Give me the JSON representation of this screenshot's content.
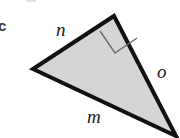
{
  "figure": {
    "part_label": "c",
    "background_color": "#ffffff",
    "width": 180,
    "height": 138
  },
  "shape": {
    "name": "right-triangle",
    "fill_color": "#d5d5d5",
    "stroke_color": "#111111",
    "stroke_width": 4,
    "vertices": [
      {
        "name": "left-vertex",
        "x": 33,
        "y": 69
      },
      {
        "name": "top-vertex",
        "x": 114,
        "y": 16
      },
      {
        "name": "bottom-right-vertex",
        "x": 176,
        "y": 136
      }
    ],
    "points_attr": "33,69 114,16 176,136"
  },
  "right_angle": {
    "at_vertex": "top-vertex",
    "marker_color": "#6a6a6a",
    "marker_width": 1.4,
    "points_attr": "100,31 115,53 137,38"
  },
  "labels": {
    "n": "n",
    "o": "o",
    "m": "m"
  },
  "sides": [
    {
      "id": "n",
      "label": "n",
      "from": "left-vertex",
      "to": "top-vertex"
    },
    {
      "id": "o",
      "label": "o",
      "from": "top-vertex",
      "to": "bottom-right-vertex"
    },
    {
      "id": "m",
      "label": "m",
      "from": "left-vertex",
      "to": "bottom-right-vertex"
    }
  ]
}
